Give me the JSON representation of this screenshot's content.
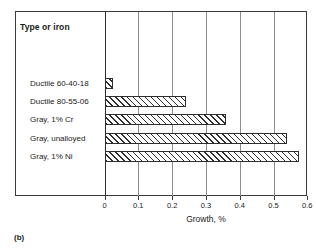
{
  "figure": {
    "caption": "(b)",
    "column_header": "Type or iron"
  },
  "chart_data": {
    "type": "bar",
    "orientation": "horizontal",
    "title": "",
    "subtitle": "",
    "xlabel": "Growth, %",
    "ylabel": "Type or iron",
    "xlim": [
      0,
      0.6
    ],
    "xticks": [
      0,
      0.1,
      0.2,
      0.3,
      0.4,
      0.5,
      0.6
    ],
    "xtick_labels": [
      "0",
      "0.1",
      "0.2",
      "0.3",
      "0.4",
      "0.5",
      "0.6"
    ],
    "grid": true,
    "grid_axis": "x",
    "legend": false,
    "bar_fill": "white-hatched-45deg",
    "bar_edge_color": "#2e2e2e",
    "categories": [
      "Ductile 60-40-18",
      "Ductile 80-55-06",
      "Gray, 1% Cr",
      "Gray, unalloyed",
      "Gray, 1% Ni"
    ],
    "values": [
      0.025,
      0.24,
      0.36,
      0.54,
      0.575
    ],
    "units": "%"
  }
}
